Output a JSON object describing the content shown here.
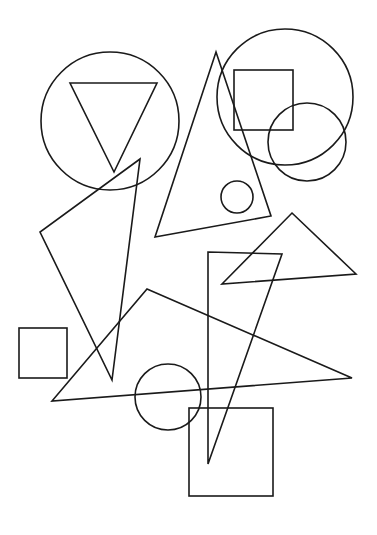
{
  "canvas": {
    "width": 377,
    "height": 535,
    "background": "#ffffff",
    "stroke": "#1a1a1a"
  },
  "shapes": {
    "circles": [
      {
        "id": "circle-top-left",
        "cx": 110,
        "cy": 121,
        "r": 69
      },
      {
        "id": "circle-top-right-large",
        "cx": 285,
        "cy": 97,
        "r": 68
      },
      {
        "id": "circle-top-right-small",
        "cx": 307,
        "cy": 142,
        "r": 39
      },
      {
        "id": "circle-small-middle",
        "cx": 237,
        "cy": 197,
        "r": 16
      },
      {
        "id": "circle-bottom",
        "cx": 168,
        "cy": 397,
        "r": 33
      }
    ],
    "rects": [
      {
        "id": "square-top-right",
        "x": 234,
        "y": 70,
        "w": 59,
        "h": 60
      },
      {
        "id": "square-left",
        "x": 19,
        "y": 328,
        "w": 48,
        "h": 50
      },
      {
        "id": "square-bottom",
        "x": 189,
        "y": 408,
        "w": 84,
        "h": 88
      }
    ],
    "triangles": [
      {
        "id": "triangle-inverted",
        "points": "70,83 157,83 114,172"
      },
      {
        "id": "triangle-tall-middle",
        "points": "216,52 271,216 155,237"
      },
      {
        "id": "triangle-left",
        "points": "140,159 40,232 112,380"
      },
      {
        "id": "triangle-right",
        "points": "292,213 356,274 222,284"
      },
      {
        "id": "triangle-narrow",
        "points": "208,252 282,254 208,464"
      },
      {
        "id": "triangle-wide",
        "points": "147,289 352,378 52,401"
      }
    ]
  }
}
